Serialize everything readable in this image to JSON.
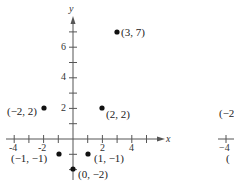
{
  "chart_data": {
    "type": "scatter",
    "title": "",
    "xlabel": "x",
    "ylabel": "y",
    "xlim": [
      -4.5,
      5
    ],
    "ylim": [
      -2.5,
      7.7
    ],
    "grid": false,
    "x_tick_labels": [
      "-4",
      "-2",
      "2",
      "4"
    ],
    "y_tick_labels": [
      "2",
      "4",
      "6"
    ],
    "points": [
      {
        "x": 3,
        "y": 7,
        "label": "(3, 7)"
      },
      {
        "x": -2,
        "y": 2,
        "label": "(−2, 2)"
      },
      {
        "x": 2,
        "y": 2,
        "label": "(2, 2)"
      },
      {
        "x": -1,
        "y": -1,
        "label": "(−1, −1)"
      },
      {
        "x": 1,
        "y": -1,
        "label": "(1, −1)"
      },
      {
        "x": 0,
        "y": -2,
        "label": "(0, −2)"
      }
    ],
    "partial_adjacent_figure": {
      "visible_text": [
        "(−2",
        "−4",
        "("
      ]
    }
  },
  "colors": {
    "axis": "#555555",
    "point": "#111111",
    "text": "#222222"
  }
}
